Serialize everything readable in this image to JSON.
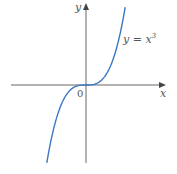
{
  "chart_data": {
    "type": "line",
    "title": "",
    "function": "y = x^3",
    "series": [
      {
        "name": "y = x³",
        "color": "#3a78c2",
        "x": [
          -1.6,
          -1.4,
          -1.2,
          -1.0,
          -0.8,
          -0.6,
          -0.4,
          -0.2,
          0,
          0.2,
          0.4,
          0.6,
          0.8,
          1.0,
          1.2,
          1.4,
          1.6
        ],
        "y": [
          -4.096,
          -2.744,
          -1.728,
          -1.0,
          -0.512,
          -0.216,
          -0.064,
          -0.008,
          0,
          0.008,
          0.064,
          0.216,
          0.512,
          1.0,
          1.728,
          2.744,
          4.096
        ]
      }
    ],
    "xlabel": "x",
    "ylabel": "y",
    "origin_label": "0",
    "annotations": [
      {
        "text": "y = x³",
        "near": "upper branch of curve"
      }
    ],
    "grid": false,
    "axes": {
      "x_arrow": true,
      "y_arrow": true,
      "ticks": false
    },
    "axis_color": "#666666"
  },
  "labels": {
    "y_axis": "y",
    "x_axis": "x",
    "origin": "0",
    "equation_lhs": "y = x",
    "equation_exp": "3"
  }
}
